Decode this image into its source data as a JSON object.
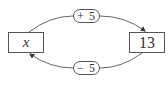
{
  "diagram": {
    "nodes": [
      {
        "id": "left",
        "label": "x"
      },
      {
        "id": "right",
        "label": "13"
      }
    ],
    "edges": [
      {
        "from": "left",
        "to": "right",
        "label": "+ 5",
        "position": "top"
      },
      {
        "from": "right",
        "to": "left",
        "label": "− 5",
        "position": "bottom"
      }
    ],
    "stroke_color": "#555555"
  }
}
